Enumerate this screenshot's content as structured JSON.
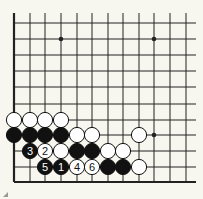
{
  "diagram": {
    "type": "go-board-problem",
    "colors": {
      "background": "#f7f6ef",
      "line": "#222222",
      "black": "#111111",
      "white": "#ffffff"
    },
    "grid": {
      "cols_x": [
        14,
        30,
        45,
        61,
        77,
        92,
        108,
        123,
        139,
        154,
        170,
        186
      ],
      "rows_y": [
        23,
        39,
        55,
        71,
        87,
        104,
        120,
        135,
        151,
        167,
        182
      ],
      "right_extent": 196,
      "top_extent": 13,
      "left_edge": true,
      "bottom_edge": true
    },
    "star_points": [
      {
        "col": 3,
        "row": 1
      },
      {
        "col": 9,
        "row": 1
      },
      {
        "col": 9,
        "row": 7
      }
    ],
    "stones": [
      {
        "color": "white",
        "col": 0,
        "row": 6,
        "label": ""
      },
      {
        "color": "white",
        "col": 1,
        "row": 6,
        "label": ""
      },
      {
        "color": "white",
        "col": 2,
        "row": 6,
        "label": ""
      },
      {
        "color": "white",
        "col": 3,
        "row": 6,
        "label": ""
      },
      {
        "color": "black",
        "col": 0,
        "row": 7,
        "label": ""
      },
      {
        "color": "black",
        "col": 1,
        "row": 7,
        "label": ""
      },
      {
        "color": "black",
        "col": 2,
        "row": 7,
        "label": ""
      },
      {
        "color": "black",
        "col": 3,
        "row": 7,
        "label": ""
      },
      {
        "color": "white",
        "col": 4,
        "row": 7,
        "label": ""
      },
      {
        "color": "white",
        "col": 5,
        "row": 7,
        "label": ""
      },
      {
        "color": "white",
        "col": 8,
        "row": 7,
        "label": ""
      },
      {
        "color": "black",
        "col": 1,
        "row": 8,
        "label": "3"
      },
      {
        "color": "white",
        "col": 2,
        "row": 8,
        "label": "2"
      },
      {
        "color": "white",
        "col": 3,
        "row": 8,
        "label": ""
      },
      {
        "color": "black",
        "col": 4,
        "row": 8,
        "label": ""
      },
      {
        "color": "black",
        "col": 5,
        "row": 8,
        "label": ""
      },
      {
        "color": "white",
        "col": 6,
        "row": 8,
        "label": ""
      },
      {
        "color": "white",
        "col": 7,
        "row": 8,
        "label": ""
      },
      {
        "color": "black",
        "col": 2,
        "row": 9,
        "label": "5"
      },
      {
        "color": "black",
        "col": 3,
        "row": 9,
        "label": "1"
      },
      {
        "color": "white",
        "col": 4,
        "row": 9,
        "label": "4"
      },
      {
        "color": "white",
        "col": 5,
        "row": 9,
        "label": "6"
      },
      {
        "color": "black",
        "col": 6,
        "row": 9,
        "label": ""
      },
      {
        "color": "black",
        "col": 7,
        "row": 9,
        "label": ""
      },
      {
        "color": "white",
        "col": 8,
        "row": 9,
        "label": ""
      }
    ]
  }
}
